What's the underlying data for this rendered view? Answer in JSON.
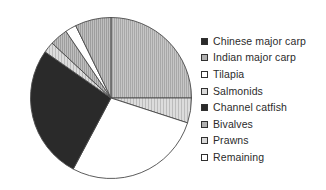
{
  "chart_data": {
    "type": "pie",
    "title": "",
    "subtitle": "",
    "xlabel": "",
    "ylabel": "",
    "legend_position": "right",
    "grid": false,
    "start_angle_deg": 0,
    "direction": "clockwise",
    "categories": [
      "Chinese major carp",
      "Indian major carp",
      "Tilapia",
      "Salmonids",
      "Channel catfish",
      "Bivalves",
      "Prawns",
      "Remaining"
    ],
    "values": [
      25,
      5,
      28,
      2,
      27,
      3,
      2,
      8
    ],
    "slices": [
      {
        "label": "Chinese major carp",
        "value": 25,
        "percent": 25,
        "start_deg": 0,
        "end_deg": 90,
        "fill": "#b8b8b8",
        "pattern": "vertical-hatch",
        "legend_swatch": "solid-black"
      },
      {
        "label": "Indian major carp",
        "value": 5,
        "percent": 5,
        "start_deg": 90,
        "end_deg": 108,
        "fill": "#cfcfcf",
        "pattern": "light-hatch",
        "legend_swatch": "gray"
      },
      {
        "label": "Tilapia",
        "value": 28,
        "percent": 28,
        "start_deg": 108,
        "end_deg": 208,
        "fill": "#ffffff",
        "pattern": "none",
        "legend_swatch": "white"
      },
      {
        "label": "Channel catfish",
        "value": 27,
        "percent": 27,
        "start_deg": 208,
        "end_deg": 305,
        "fill": "#2a2a2a",
        "pattern": "solid",
        "legend_swatch": "solid-black"
      },
      {
        "label": "Salmonids",
        "value": 2,
        "percent": 2,
        "start_deg": 305,
        "end_deg": 313,
        "fill": "#c0c0c0",
        "pattern": "light-hatch",
        "legend_swatch": "light-hatch"
      },
      {
        "label": "Bivalves",
        "value": 3,
        "percent": 3,
        "start_deg": 313,
        "end_deg": 326,
        "fill": "#b5b5b5",
        "pattern": "hatch",
        "legend_swatch": "gray"
      },
      {
        "label": "Prawns",
        "value": 2,
        "percent": 2,
        "start_deg": 326,
        "end_deg": 334,
        "fill": "#ffffff",
        "pattern": "none",
        "legend_swatch": "light-hatch"
      },
      {
        "label": "Remaining",
        "value": 8,
        "percent": 8,
        "start_deg": 334,
        "end_deg": 360,
        "fill": "#bdbdbd",
        "pattern": "hatch",
        "legend_swatch": "white"
      }
    ]
  },
  "legend": {
    "items": [
      {
        "label": "Chinese major carp",
        "swatch": "solid-black"
      },
      {
        "label": "Indian major carp",
        "swatch": "gray"
      },
      {
        "label": "Tilapia",
        "swatch": "white"
      },
      {
        "label": "Salmonids",
        "swatch": "light-hatch"
      },
      {
        "label": "Channel catfish",
        "swatch": "solid-black"
      },
      {
        "label": "Bivalves",
        "swatch": "gray"
      },
      {
        "label": "Prawns",
        "swatch": "light-hatch"
      },
      {
        "label": "Remaining",
        "swatch": "white"
      }
    ]
  },
  "colors": {
    "background": "#ffffff",
    "outline": "#4a4a4a",
    "text": "#2b2b2b",
    "solid_black": "#2a2a2a",
    "gray": "#b0b0b0",
    "light_gray": "#d2d2d2",
    "white": "#ffffff"
  }
}
